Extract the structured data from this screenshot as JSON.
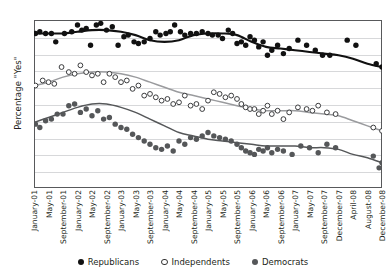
{
  "chart_data": {
    "type": "scatter",
    "title": "",
    "xlabel": "",
    "ylabel": "Percentage \"Yes\"",
    "ylim": [
      0,
      100
    ],
    "yticks": [
      0,
      10,
      20,
      30,
      40,
      50,
      60,
      70,
      80,
      90,
      100
    ],
    "grid": true,
    "legend_position": "bottom",
    "categories": [
      "January-01",
      "May-01",
      "September-01",
      "January-02",
      "May-02",
      "September-02",
      "January-03",
      "May-03",
      "September-03",
      "January-04",
      "May-04",
      "September-04",
      "January-05",
      "May-05",
      "September-05",
      "January-06",
      "May-06",
      "September-06",
      "January-07",
      "May-07",
      "September-07",
      "December-07",
      "April-08",
      "August-08",
      "December-08"
    ],
    "series": [
      {
        "name": "Republicans",
        "marker": "filled-circle",
        "color": "#111111",
        "trend": [
          92,
          92,
          92,
          93,
          94,
          94,
          93,
          91,
          88,
          87,
          88,
          91,
          92,
          92,
          91,
          87,
          84,
          83,
          82,
          81,
          80,
          79,
          77,
          74,
          72
        ],
        "points": [
          [
            0.1,
            92
          ],
          [
            0.4,
            93
          ],
          [
            0.8,
            92
          ],
          [
            1.2,
            92
          ],
          [
            1.5,
            87
          ],
          [
            2.1,
            92
          ],
          [
            2.6,
            93
          ],
          [
            3.0,
            97
          ],
          [
            3.3,
            94
          ],
          [
            3.6,
            95
          ],
          [
            3.9,
            85
          ],
          [
            4.3,
            97
          ],
          [
            4.6,
            98
          ],
          [
            5.0,
            94
          ],
          [
            5.4,
            96
          ],
          [
            5.8,
            85
          ],
          [
            6.2,
            90
          ],
          [
            6.5,
            91
          ],
          [
            6.9,
            87
          ],
          [
            7.2,
            86
          ],
          [
            7.6,
            87
          ],
          [
            8.0,
            89
          ],
          [
            8.4,
            93
          ],
          [
            8.7,
            91
          ],
          [
            9.1,
            92
          ],
          [
            9.4,
            93
          ],
          [
            9.7,
            97
          ],
          [
            10.1,
            93
          ],
          [
            10.4,
            91
          ],
          [
            10.8,
            92
          ],
          [
            11.2,
            92
          ],
          [
            11.6,
            93
          ],
          [
            12.0,
            92
          ],
          [
            12.3,
            91
          ],
          [
            12.7,
            91
          ],
          [
            13.0,
            89
          ],
          [
            13.4,
            94
          ],
          [
            13.7,
            92
          ],
          [
            14.0,
            86
          ],
          [
            14.3,
            87
          ],
          [
            14.6,
            85
          ],
          [
            14.9,
            90
          ],
          [
            15.2,
            88
          ],
          [
            15.5,
            84
          ],
          [
            15.8,
            87
          ],
          [
            16.1,
            79
          ],
          [
            16.4,
            82
          ],
          [
            16.8,
            85
          ],
          [
            17.2,
            80
          ],
          [
            17.6,
            83
          ],
          [
            18.2,
            88
          ],
          [
            18.8,
            85
          ],
          [
            19.4,
            82
          ],
          [
            19.9,
            79
          ],
          [
            20.4,
            79
          ],
          [
            21.6,
            88
          ],
          [
            22.2,
            85
          ],
          [
            23.6,
            74
          ],
          [
            24.0,
            72
          ]
        ]
      },
      {
        "name": "Independents",
        "marker": "open-circle",
        "color": "#9a9b9e",
        "trend": [
          61,
          63,
          66,
          68,
          69,
          69,
          68,
          66,
          63,
          60,
          57,
          55,
          53,
          51,
          49,
          47,
          46,
          46,
          46,
          45,
          44,
          43,
          40,
          37,
          34
        ],
        "points": [
          [
            0.1,
            61
          ],
          [
            0.6,
            64
          ],
          [
            1.0,
            63
          ],
          [
            1.4,
            62
          ],
          [
            1.9,
            72
          ],
          [
            2.4,
            69
          ],
          [
            2.8,
            68
          ],
          [
            3.2,
            73
          ],
          [
            3.6,
            69
          ],
          [
            4.0,
            67
          ],
          [
            4.4,
            68
          ],
          [
            4.8,
            63
          ],
          [
            5.2,
            68
          ],
          [
            5.6,
            66
          ],
          [
            6.0,
            63
          ],
          [
            6.4,
            64
          ],
          [
            6.8,
            59
          ],
          [
            7.2,
            61
          ],
          [
            7.6,
            55
          ],
          [
            8.0,
            56
          ],
          [
            8.4,
            54
          ],
          [
            8.8,
            52
          ],
          [
            9.2,
            53
          ],
          [
            9.6,
            50
          ],
          [
            10.0,
            51
          ],
          [
            10.4,
            55
          ],
          [
            10.8,
            49
          ],
          [
            11.2,
            50
          ],
          [
            11.6,
            47
          ],
          [
            12.0,
            52
          ],
          [
            12.4,
            57
          ],
          [
            12.8,
            56
          ],
          [
            13.2,
            54
          ],
          [
            13.6,
            55
          ],
          [
            14.0,
            53
          ],
          [
            14.3,
            50
          ],
          [
            14.6,
            48
          ],
          [
            14.9,
            47
          ],
          [
            15.2,
            47
          ],
          [
            15.5,
            44
          ],
          [
            15.8,
            46
          ],
          [
            16.1,
            49
          ],
          [
            16.4,
            44
          ],
          [
            16.8,
            46
          ],
          [
            17.2,
            41
          ],
          [
            17.6,
            45
          ],
          [
            18.2,
            48
          ],
          [
            18.8,
            47
          ],
          [
            19.2,
            46
          ],
          [
            19.6,
            49
          ],
          [
            20.2,
            45
          ],
          [
            20.8,
            44
          ],
          [
            23.4,
            36
          ],
          [
            24.0,
            34
          ]
        ]
      },
      {
        "name": "Democrats",
        "marker": "filled-circle",
        "color": "#555759",
        "trend": [
          39,
          42,
          45,
          48,
          50,
          50,
          48,
          45,
          41,
          37,
          33,
          31,
          29,
          28,
          27,
          26,
          25,
          25,
          25,
          24,
          24,
          23,
          20,
          18,
          15
        ],
        "points": [
          [
            0.1,
            38
          ],
          [
            0.4,
            36
          ],
          [
            0.8,
            40
          ],
          [
            1.2,
            41
          ],
          [
            1.6,
            44
          ],
          [
            2.0,
            44
          ],
          [
            2.4,
            49
          ],
          [
            2.8,
            50
          ],
          [
            3.2,
            45
          ],
          [
            3.6,
            47
          ],
          [
            4.0,
            43
          ],
          [
            4.4,
            46
          ],
          [
            4.8,
            41
          ],
          [
            5.2,
            42
          ],
          [
            5.6,
            38
          ],
          [
            6.0,
            36
          ],
          [
            6.4,
            35
          ],
          [
            6.8,
            32
          ],
          [
            7.2,
            30
          ],
          [
            7.6,
            28
          ],
          [
            8.0,
            26
          ],
          [
            8.4,
            24
          ],
          [
            8.8,
            23
          ],
          [
            9.2,
            25
          ],
          [
            9.6,
            22
          ],
          [
            10.0,
            28
          ],
          [
            10.4,
            26
          ],
          [
            10.8,
            30
          ],
          [
            11.2,
            29
          ],
          [
            11.6,
            31
          ],
          [
            12.0,
            33
          ],
          [
            12.4,
            31
          ],
          [
            12.8,
            30
          ],
          [
            13.2,
            29
          ],
          [
            13.6,
            28
          ],
          [
            14.0,
            26
          ],
          [
            14.3,
            24
          ],
          [
            14.6,
            22
          ],
          [
            14.9,
            21
          ],
          [
            15.2,
            20
          ],
          [
            15.5,
            23
          ],
          [
            15.8,
            22
          ],
          [
            16.1,
            24
          ],
          [
            16.4,
            21
          ],
          [
            16.8,
            23
          ],
          [
            17.2,
            22
          ],
          [
            17.8,
            20
          ],
          [
            18.4,
            25
          ],
          [
            19.0,
            24
          ],
          [
            19.6,
            21
          ],
          [
            20.2,
            26
          ],
          [
            20.8,
            24
          ],
          [
            23.4,
            19
          ],
          [
            23.8,
            12
          ],
          [
            24.0,
            15
          ]
        ]
      }
    ]
  },
  "legend": {
    "items": [
      {
        "label": "Republicans",
        "marker": "filled-circle"
      },
      {
        "label": "Independents",
        "marker": "open-circle"
      },
      {
        "label": "Democrats",
        "marker": "filled-circle"
      }
    ]
  },
  "colors": {
    "republicans": "#111111",
    "independents": "#9a9b9e",
    "democrats": "#555759",
    "axis": "#58595b",
    "grid": "#d7d8da"
  }
}
